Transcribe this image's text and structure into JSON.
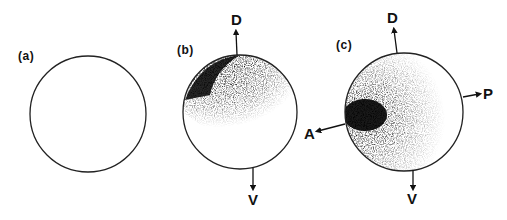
{
  "figure": {
    "panels": [
      {
        "id": "a",
        "label": "(a)",
        "shading": "none",
        "axes": []
      },
      {
        "id": "b",
        "label": "(b)",
        "shading": "dark dorsal cap, dark on left side of cap",
        "axes": [
          {
            "direction": "up",
            "label": "D"
          },
          {
            "direction": "down",
            "label": "V"
          }
        ]
      },
      {
        "id": "c",
        "label": "(c)",
        "shading": "dark dorsal and anterior regions, darkest at anterior-left",
        "axes": [
          {
            "direction": "up",
            "label": "D"
          },
          {
            "direction": "down",
            "label": "V"
          },
          {
            "direction": "left",
            "label": "A"
          },
          {
            "direction": "right",
            "label": "P"
          }
        ]
      }
    ]
  },
  "labels": {
    "a": "(a)",
    "b": "(b)",
    "c": "(c)",
    "b_dorsal": "D",
    "b_ventral": "V",
    "c_dorsal": "D",
    "c_ventral": "V",
    "c_anterior": "A",
    "c_posterior": "P"
  },
  "colors": {
    "ink": "#111111",
    "background": "#ffffff"
  }
}
